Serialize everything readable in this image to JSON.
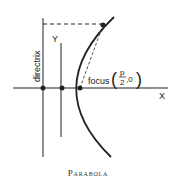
{
  "figure": {
    "caption": "Parabola",
    "labels": {
      "directrix": "directrix",
      "y_axis": "Y",
      "x_axis": "X",
      "focus": "focus",
      "focus_coord_num": "p",
      "focus_coord_den": "2",
      "focus_coord_rest": ",0"
    },
    "colors": {
      "stroke": "#222222",
      "background": "#ffffff"
    }
  }
}
